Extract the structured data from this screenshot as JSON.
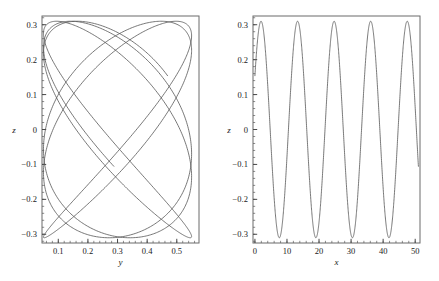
{
  "figure": {
    "background": "#ffffff",
    "curve_color": "#555555",
    "axis_color": "#4a4a4a",
    "text_color": "#1a1a1a"
  },
  "chart_data": [
    {
      "type": "line",
      "panel": "left",
      "title": "",
      "xlabel": "y",
      "ylabel": "z",
      "xlim": [
        0.045,
        0.575
      ],
      "ylim": [
        -0.325,
        0.325
      ],
      "xticks": [
        0.1,
        0.2,
        0.3,
        0.4,
        0.5
      ],
      "xticklabels": [
        "0.1",
        "0.2",
        "0.3",
        "0.4",
        "0.5"
      ],
      "yticks": [
        -0.3,
        -0.2,
        -0.1,
        0,
        0.1,
        0.2,
        0.3
      ],
      "yticklabels": [
        "-0.3",
        "-0.2",
        "-0.1",
        "0",
        "0.1",
        "0.2",
        "0.3"
      ],
      "minor_ticks_per_interval": 5,
      "grid": false,
      "legend": "none",
      "description": "Phase-space trajectory of z versus y forming an interleaved multi-loop Lissajous curve with five teardrop lobes above and below z=0",
      "parametric": {
        "y_mean": 0.3,
        "y_amplitude": 0.25,
        "y_frequency": 0.11,
        "y_phase": 2.4,
        "z_amplitude": 0.31,
        "z_frequency": 0.551,
        "z_phase": 0.52,
        "t_start": 0,
        "t_end": 51,
        "samples": 1600
      }
    },
    {
      "type": "line",
      "panel": "right",
      "title": "",
      "xlabel": "x",
      "ylabel": "z",
      "xlim": [
        -0.6,
        51.5
      ],
      "ylim": [
        -0.325,
        0.325
      ],
      "xticks": [
        0,
        10,
        20,
        30,
        40,
        50
      ],
      "xticklabels": [
        "0",
        "10",
        "20",
        "30",
        "40",
        "50"
      ],
      "yticks": [
        -0.3,
        -0.2,
        -0.1,
        0,
        0.1,
        0.2,
        0.3
      ],
      "yticklabels": [
        "-0.3",
        "-0.2",
        "-0.1",
        "0",
        "0.1",
        "0.2",
        "0.3"
      ],
      "minor_ticks_per_interval": 5,
      "grid": false,
      "legend": "none",
      "description": "Oscillation of z versus x showing about five full periods of amplitude 0.31, period approximately 11.4",
      "waveform": {
        "amplitude": 0.31,
        "frequency": 0.551,
        "phase": 0.52,
        "x_start": 0,
        "x_end": 51,
        "samples": 1600,
        "start_value": 0.16,
        "peaks_x": [
          1.9,
          13.3,
          24.7,
          36.1,
          47.5
        ],
        "troughs_x": [
          7.6,
          19.0,
          30.4,
          41.8
        ],
        "peak_value": 0.31,
        "trough_value": -0.31
      }
    }
  ]
}
